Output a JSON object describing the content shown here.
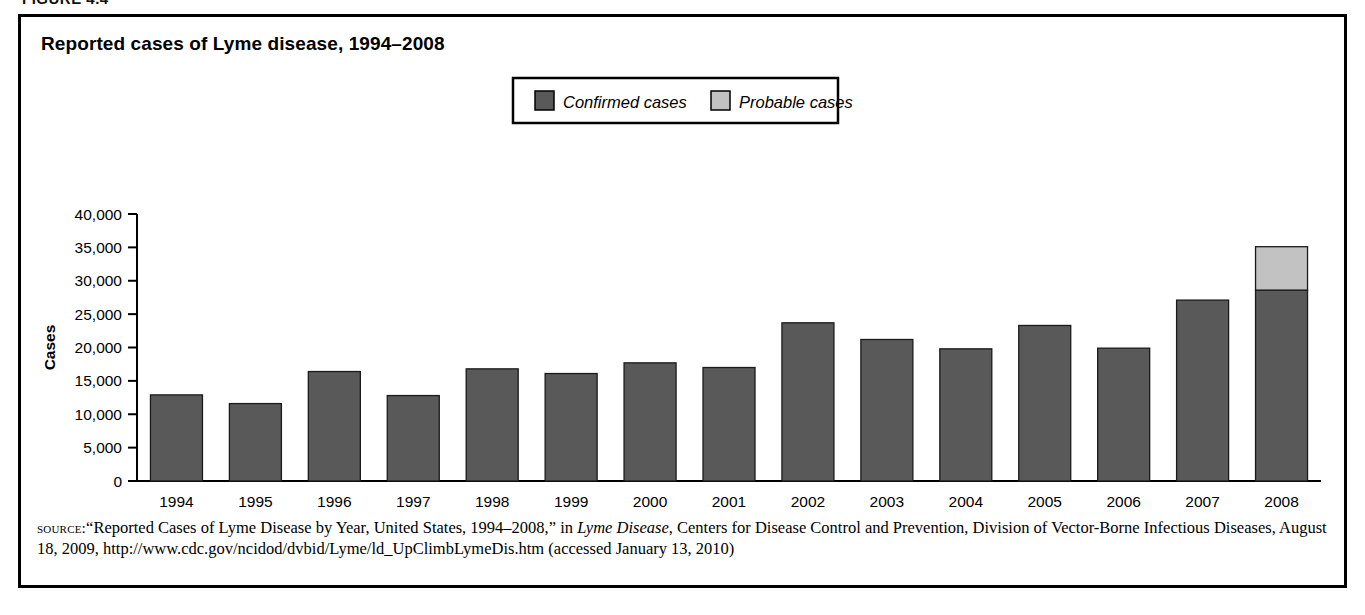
{
  "figure": {
    "caption": "FIGURE 4.4",
    "title": "Reported cases of Lyme disease, 1994–2008"
  },
  "legend": {
    "items": [
      {
        "label": "Confirmed cases",
        "color": "#595959"
      },
      {
        "label": "Probable cases",
        "color": "#c2c2c2"
      }
    ]
  },
  "axes": {
    "y_title": "Cases",
    "y_ticks": [
      "40,000",
      "35,000",
      "30,000",
      "25,000",
      "20,000",
      "15,000",
      "10,000",
      "5,000",
      "0"
    ]
  },
  "source": {
    "label": "source:",
    "line1_a": "“Reported Cases of Lyme Disease by Year, United States, 1994–2008,” in ",
    "line1_italic": "Lyme Disease",
    "line1_b": ", Centers for Disease Control and Prevention, Division of",
    "line2": "Vector-Borne Infectious Diseases, August 18, 2009, http://www.cdc.gov/ncidod/dvbid/Lyme/ld_UpClimbLymeDis.htm (accessed January 13, 2010)"
  },
  "chart_data": {
    "type": "bar",
    "stacked": true,
    "title": "Reported cases of Lyme disease, 1994–2008",
    "xlabel": "",
    "ylabel": "Cases",
    "ylim": [
      0,
      40000
    ],
    "ytick_interval": 5000,
    "grid": false,
    "legend_position": "top-right",
    "categories": [
      "1994",
      "1995",
      "1996",
      "1997",
      "1998",
      "1999",
      "2000",
      "2001",
      "2002",
      "2003",
      "2004",
      "2005",
      "2006",
      "2007",
      "2008"
    ],
    "series": [
      {
        "name": "Confirmed cases",
        "color": "#595959",
        "values": [
          12900,
          11600,
          16400,
          12800,
          16800,
          16100,
          17700,
          17000,
          23700,
          21200,
          19800,
          23300,
          19900,
          27100,
          28600
        ]
      },
      {
        "name": "Probable cases",
        "color": "#c2c2c2",
        "values": [
          0,
          0,
          0,
          0,
          0,
          0,
          0,
          0,
          0,
          0,
          0,
          0,
          0,
          0,
          6500
        ]
      }
    ]
  }
}
